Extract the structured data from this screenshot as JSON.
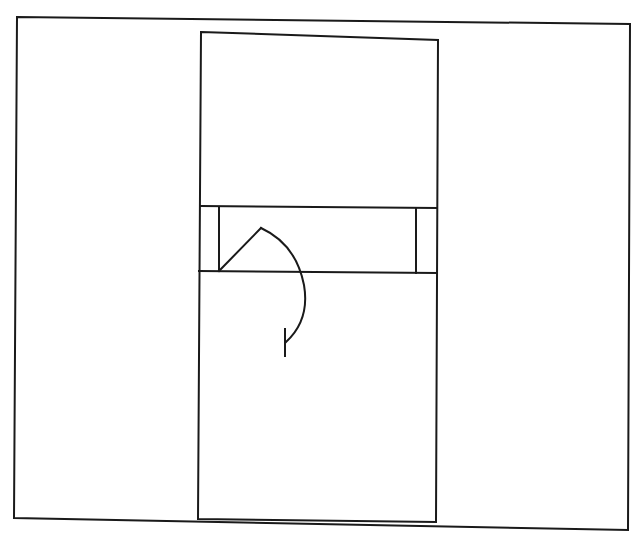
{
  "diagram": {
    "type": "floor-plan-line-drawing",
    "stroke_color": "#1a1a1a",
    "background": "#ffffff",
    "elements": {
      "outer_frame": {
        "points": [
          [
            17,
            17
          ],
          [
            630,
            24
          ],
          [
            628,
            530
          ],
          [
            14,
            518
          ]
        ]
      },
      "inner_rect": {
        "points": [
          [
            201,
            32
          ],
          [
            438,
            40
          ],
          [
            436,
            522
          ],
          [
            198,
            519
          ]
        ]
      },
      "band_top_line": {
        "x1": 201,
        "y1": 206,
        "x2": 437,
        "y2": 208
      },
      "band_bottom_line": {
        "x1": 199,
        "y1": 271,
        "x2": 437,
        "y2": 273
      },
      "left_post": {
        "x1": 219,
        "y1": 207,
        "x2": 219,
        "y2": 271
      },
      "right_post": {
        "x1": 416,
        "y1": 208,
        "x2": 416,
        "y2": 273
      },
      "door_leaf": {
        "x1": 219,
        "y1": 271,
        "x2": 261,
        "y2": 228
      },
      "swing_arc": {
        "path": "M261,228 Q296,244 304,285 Q310,320 286,342"
      },
      "end_tick": {
        "x1": 285,
        "y1": 329,
        "x2": 285,
        "y2": 356
      }
    }
  }
}
